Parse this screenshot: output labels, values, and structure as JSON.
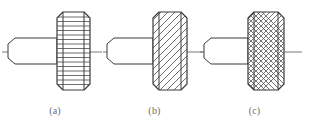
{
  "drawing": {
    "title": "Knurled head screw — three representation methods",
    "background_color": "#ffffff",
    "line_color": "#3a3a3a",
    "hatch_color": "#4a4a4a",
    "centerline_color": "#6a6a6a",
    "caption_color": "#6d6d6d"
  },
  "figures": [
    {
      "id": "a",
      "caption": "(a)",
      "knurl_style": "straight-knurl-horizontal-lines",
      "head": {
        "left": 57,
        "right": 90,
        "top": 12,
        "bottom": 90,
        "chamfer": 6
      },
      "shaft": {
        "left": 8,
        "right": 57,
        "top": 38,
        "bottom": 64,
        "break_offset": 7
      },
      "centerline": {
        "y": 52,
        "left": 2,
        "right": 104
      },
      "hatch_lines": 17
    },
    {
      "id": "b",
      "caption": "(b)",
      "knurl_style": "diagonal-section-hatch-45deg",
      "head": {
        "left": 50,
        "right": 84,
        "top": 12,
        "bottom": 90,
        "chamfer": 6
      },
      "shaft": {
        "left": 4,
        "right": 50,
        "top": 38,
        "bottom": 64,
        "break_offset": 7
      },
      "centerline": {
        "y": 52,
        "left": 0,
        "right": 100
      },
      "hatch_spacing": 7
    },
    {
      "id": "c",
      "caption": "(c)",
      "knurl_style": "diamond-cross-knurl",
      "head": {
        "left": 48,
        "right": 84,
        "top": 12,
        "bottom": 90,
        "chamfer": 6
      },
      "shaft": {
        "left": 4,
        "right": 48,
        "top": 38,
        "bottom": 64,
        "break_offset": 7
      },
      "centerline": {
        "y": 52,
        "left": 0,
        "right": 102
      },
      "hatch_spacing": 5
    }
  ]
}
